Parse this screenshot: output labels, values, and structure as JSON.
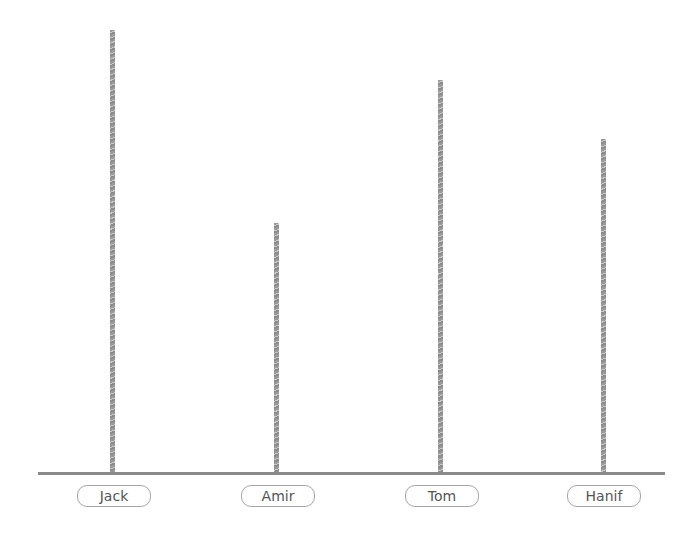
{
  "chart_data": {
    "type": "bar",
    "title": "",
    "xlabel": "",
    "ylabel": "",
    "categories": [
      "Jack",
      "Amir",
      "Tom",
      "Hanif"
    ],
    "values": [
      443,
      250,
      393,
      334
    ],
    "units": "relative bar height (px); no y-axis shown",
    "grid": false,
    "legend": "none",
    "colors": {
      "bar": "#9a9a9a",
      "baseline": "#8a8a8a",
      "label_border": "#a6a6a6",
      "label_text": "#555555"
    }
  },
  "labels": [
    "Jack",
    "Amir",
    "Tom",
    "Hanif"
  ]
}
